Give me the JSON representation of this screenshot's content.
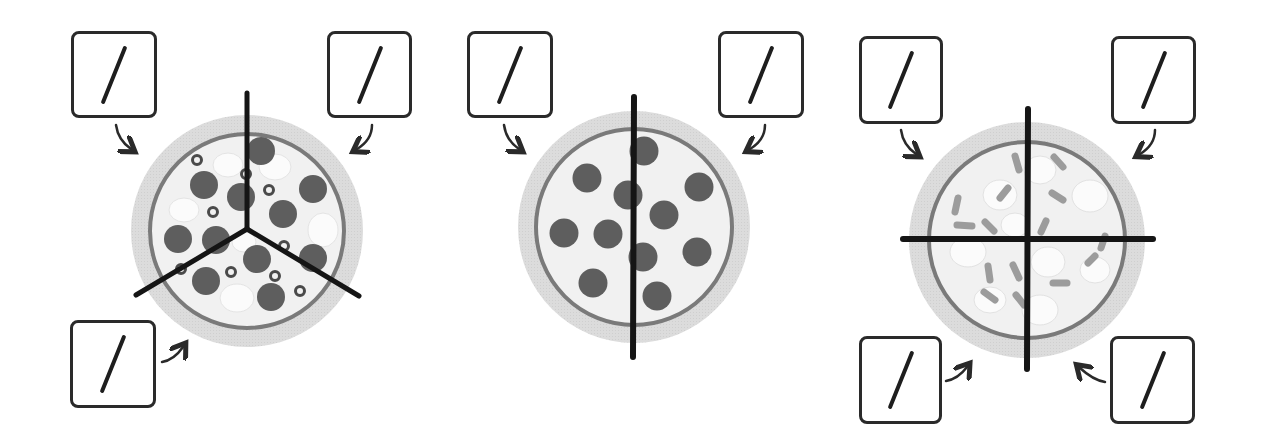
{
  "colors": {
    "crust_outer": "#d9d9d9",
    "crust_ring": "#7a7a7a",
    "cheese": "#f2f2f2",
    "pepperoni": "#5e5e5e",
    "mushroom": "#fafafa",
    "olive": "#4a4a4a",
    "pepper_strip": "#9a9a9a",
    "cut_line": "#151515",
    "box_border": "#2a2a2a"
  },
  "pizzas": [
    {
      "id": "pizza-thirds",
      "toppings": [
        "pepperoni",
        "mushroom",
        "olive"
      ],
      "parts": 3,
      "cut": "three-way",
      "boxes": [
        {
          "position": "top-left",
          "numerator": "",
          "denominator": "",
          "symbol": "/"
        },
        {
          "position": "top-right",
          "numerator": "",
          "denominator": "",
          "symbol": "/"
        },
        {
          "position": "bottom-left",
          "numerator": "",
          "denominator": "",
          "symbol": "/"
        }
      ]
    },
    {
      "id": "pizza-halves",
      "toppings": [
        "pepperoni"
      ],
      "parts": 2,
      "cut": "vertical",
      "boxes": [
        {
          "position": "top-left",
          "numerator": "",
          "denominator": "",
          "symbol": "/"
        },
        {
          "position": "top-right",
          "numerator": "",
          "denominator": "",
          "symbol": "/"
        }
      ]
    },
    {
      "id": "pizza-quarters",
      "toppings": [
        "mushroom",
        "pepper"
      ],
      "parts": 4,
      "cut": "cross",
      "boxes": [
        {
          "position": "top-left",
          "numerator": "",
          "denominator": "",
          "symbol": "/"
        },
        {
          "position": "top-right",
          "numerator": "",
          "denominator": "",
          "symbol": "/"
        },
        {
          "position": "bottom-left",
          "numerator": "",
          "denominator": "",
          "symbol": "/"
        },
        {
          "position": "bottom-right",
          "numerator": "",
          "denominator": "",
          "symbol": "/"
        }
      ]
    }
  ]
}
